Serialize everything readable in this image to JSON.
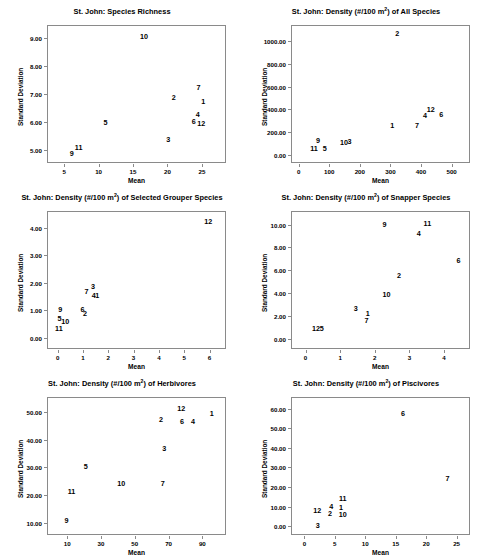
{
  "figure": {
    "shared_xlabel": "Mean",
    "shared_ylabel": "Standard Deviation",
    "superscript": "2",
    "panel_count": 6
  },
  "chart_data": [
    {
      "type": "scatter",
      "id": "species-richness",
      "title": "St. John: Species Richness",
      "title_prefix": "St. John: Species Richness",
      "title_suffix": "",
      "has_superscript": false,
      "xlabel": "Mean",
      "ylabel": "Standard Deviation",
      "xlim": [
        2.5,
        28.5
      ],
      "ylim": [
        4.55,
        9.45
      ],
      "xticks": [
        5,
        10,
        15,
        20,
        25
      ],
      "xticklabels": [
        "5",
        "10",
        "15",
        "20",
        "25"
      ],
      "yticks": [
        5.0,
        6.0,
        7.0,
        8.0,
        9.0
      ],
      "yticklabels": [
        "5.00",
        "6.00",
        "7.00",
        "8.00",
        "9.00"
      ],
      "grid": false,
      "legend": "none",
      "point_labels": [
        "1",
        "2",
        "3",
        "4",
        "5",
        "6",
        "7",
        "9",
        "10",
        "11",
        "12"
      ],
      "points": [
        {
          "label": "10",
          "x": 16.6,
          "y": 9.02
        },
        {
          "label": "7",
          "x": 24.5,
          "y": 7.22
        },
        {
          "label": "2",
          "x": 20.9,
          "y": 6.87
        },
        {
          "label": "1",
          "x": 25.2,
          "y": 6.72
        },
        {
          "label": "4",
          "x": 24.4,
          "y": 6.25
        },
        {
          "label": "6",
          "x": 23.8,
          "y": 6.0
        },
        {
          "label": "12",
          "x": 24.9,
          "y": 5.93
        },
        {
          "label": "5",
          "x": 11.0,
          "y": 5.98
        },
        {
          "label": "3",
          "x": 20.1,
          "y": 5.36
        },
        {
          "label": "11",
          "x": 7.1,
          "y": 5.1
        },
        {
          "label": "9",
          "x": 6.1,
          "y": 4.87
        }
      ]
    },
    {
      "type": "scatter",
      "id": "density-all-species",
      "title": "St. John: Density (#/100 m ) of All Species",
      "title_prefix": "St. John: Density (#/100 m",
      "title_suffix": ") of All Species",
      "has_superscript": true,
      "xlabel": "Mean",
      "ylabel": "Standard Deviation",
      "xlim": [
        -25,
        560
      ],
      "ylim": [
        -70,
        1140
      ],
      "xticks": [
        0,
        100,
        200,
        300,
        400,
        500
      ],
      "xticklabels": [
        "0",
        "100",
        "200",
        "300",
        "400",
        "500"
      ],
      "yticks": [
        0,
        200,
        400,
        600,
        800,
        1000
      ],
      "yticklabels": [
        "0.00",
        "200.00",
        "400.00",
        "600.00",
        "800.00",
        "1000.00"
      ],
      "grid": false,
      "legend": "none",
      "point_labels": [
        "1",
        "2",
        "3",
        "4",
        "5",
        "6",
        "7",
        "9",
        "10",
        "11",
        "12"
      ],
      "points": [
        {
          "label": "2",
          "x": 322,
          "y": 1062
        },
        {
          "label": "12",
          "x": 432,
          "y": 395
        },
        {
          "label": "6",
          "x": 466,
          "y": 348
        },
        {
          "label": "4",
          "x": 413,
          "y": 338
        },
        {
          "label": "7",
          "x": 387,
          "y": 255
        },
        {
          "label": "1",
          "x": 306,
          "y": 254
        },
        {
          "label": "9",
          "x": 63,
          "y": 126
        },
        {
          "label": "3",
          "x": 166,
          "y": 118
        },
        {
          "label": "10",
          "x": 148,
          "y": 104
        },
        {
          "label": "5",
          "x": 85,
          "y": 55
        },
        {
          "label": "11",
          "x": 50,
          "y": 49
        }
      ]
    },
    {
      "type": "scatter",
      "id": "density-selected-grouper",
      "title": "St. John: Density (#/100 m ) of Selected Grouper Species",
      "title_prefix": "St. John: Density (#/100 m",
      "title_suffix": ") of Selected Grouper Species",
      "has_superscript": true,
      "xlabel": "Mean",
      "ylabel": "Standard Deviation",
      "xlim": [
        -0.42,
        6.65
      ],
      "ylim": [
        -0.42,
        4.62
      ],
      "xticks": [
        0,
        1,
        2,
        3,
        4,
        5,
        6
      ],
      "xticklabels": [
        "0",
        "1",
        "2",
        "3",
        "4",
        "5",
        "6"
      ],
      "yticks": [
        0.0,
        1.0,
        2.0,
        3.0,
        4.0
      ],
      "yticklabels": [
        "0.00",
        "1.00",
        "2.00",
        "3.00",
        "4.00"
      ],
      "grid": false,
      "legend": "none",
      "point_labels": [
        "1",
        "2",
        "3",
        "4",
        "5",
        "6",
        "7",
        "9",
        "10",
        "11",
        "12"
      ],
      "points": [
        {
          "label": "12",
          "x": 5.95,
          "y": 4.22
        },
        {
          "label": "3",
          "x": 1.4,
          "y": 1.86
        },
        {
          "label": "7",
          "x": 1.14,
          "y": 1.68
        },
        {
          "label": "4",
          "x": 1.43,
          "y": 1.53
        },
        {
          "label": "1",
          "x": 1.56,
          "y": 1.51
        },
        {
          "label": "9",
          "x": 0.1,
          "y": 1.02
        },
        {
          "label": "6",
          "x": 0.98,
          "y": 1.0
        },
        {
          "label": "2",
          "x": 1.08,
          "y": 0.87
        },
        {
          "label": "5",
          "x": 0.07,
          "y": 0.66
        },
        {
          "label": "10",
          "x": 0.3,
          "y": 0.58
        },
        {
          "label": "11",
          "x": 0.05,
          "y": 0.3
        }
      ]
    },
    {
      "type": "scatter",
      "id": "density-snapper",
      "title": "St. John: Density (#/100 m ) of Snapper Species",
      "title_prefix": "St. John: Density (#/100 m",
      "title_suffix": ") of Snapper Species",
      "has_superscript": true,
      "xlabel": "Mean",
      "ylabel": "Standard Deviation",
      "xlim": [
        -0.42,
        4.75
      ],
      "ylim": [
        -0.9,
        11.2
      ],
      "xticks": [
        0,
        1,
        2,
        3,
        4
      ],
      "xticklabels": [
        "0",
        "1",
        "2",
        "3",
        "4"
      ],
      "yticks": [
        0.0,
        2.0,
        4.0,
        6.0,
        8.0,
        10.0
      ],
      "yticklabels": [
        "0.00",
        "2.00",
        "4.00",
        "6.00",
        "8.00",
        "10.00"
      ],
      "grid": false,
      "legend": "none",
      "point_labels": [
        "1",
        "2",
        "3",
        "4",
        "5",
        "6",
        "7",
        "9",
        "10",
        "11",
        "12"
      ],
      "points": [
        {
          "label": "9",
          "x": 2.28,
          "y": 10.0
        },
        {
          "label": "11",
          "x": 3.52,
          "y": 10.1
        },
        {
          "label": "4",
          "x": 3.27,
          "y": 9.15
        },
        {
          "label": "6",
          "x": 4.42,
          "y": 6.8
        },
        {
          "label": "2",
          "x": 2.7,
          "y": 5.5
        },
        {
          "label": "10",
          "x": 2.34,
          "y": 3.8
        },
        {
          "label": "3",
          "x": 1.45,
          "y": 2.65
        },
        {
          "label": "1",
          "x": 1.8,
          "y": 2.15
        },
        {
          "label": "7",
          "x": 1.76,
          "y": 1.58
        },
        {
          "label": "12",
          "x": 0.3,
          "y": 0.85
        },
        {
          "label": "5",
          "x": 0.47,
          "y": 0.88
        }
      ]
    },
    {
      "type": "scatter",
      "id": "density-herbivores",
      "title": "St. John: Density (#/100 m ) of Herbivores",
      "title_prefix": "St. John: Density (#/100 m",
      "title_suffix": ") of Herbivores",
      "has_superscript": true,
      "xlabel": "Mean",
      "ylabel": "Standard Deviation",
      "xlim": [
        -2,
        104
      ],
      "ylim": [
        5.5,
        55.5
      ],
      "xticks": [
        10,
        30,
        50,
        70,
        90
      ],
      "xticklabels": [
        "10",
        "30",
        "50",
        "70",
        "90"
      ],
      "yticks": [
        10,
        20,
        30,
        40,
        50
      ],
      "yticklabels": [
        "10.00",
        "20.00",
        "30.00",
        "40.00",
        "50.00"
      ],
      "grid": false,
      "legend": "none",
      "point_labels": [
        "1",
        "2",
        "3",
        "4",
        "5",
        "6",
        "7",
        "9",
        "10",
        "11",
        "12"
      ],
      "points": [
        {
          "label": "12",
          "x": 77.5,
          "y": 51.2
        },
        {
          "label": "1",
          "x": 95.5,
          "y": 49.5
        },
        {
          "label": "2",
          "x": 65.5,
          "y": 47.2
        },
        {
          "label": "6",
          "x": 78.0,
          "y": 46.3
        },
        {
          "label": "4",
          "x": 84.5,
          "y": 46.5
        },
        {
          "label": "3",
          "x": 67.5,
          "y": 36.5
        },
        {
          "label": "5",
          "x": 21.0,
          "y": 30.2
        },
        {
          "label": "10",
          "x": 42.0,
          "y": 23.8
        },
        {
          "label": "7",
          "x": 66.5,
          "y": 23.8
        },
        {
          "label": "11",
          "x": 12.5,
          "y": 21.0
        },
        {
          "label": "9",
          "x": 9.5,
          "y": 10.6
        }
      ]
    },
    {
      "type": "scatter",
      "id": "density-piscivores",
      "title": "St. John: Density (#/100 m ) of Piscivores",
      "title_prefix": "St. John: Density (#/100 m",
      "title_suffix": ") of Piscivores",
      "has_superscript": true,
      "xlabel": "Mean",
      "ylabel": "Standard Deviation",
      "xlim": [
        -2.2,
        27.2
      ],
      "ylim": [
        -4.5,
        66
      ],
      "xticks": [
        0,
        5,
        10,
        15,
        20,
        25
      ],
      "xticklabels": [
        "0",
        "5",
        "10",
        "15",
        "20",
        "25"
      ],
      "yticks": [
        0,
        10,
        20,
        30,
        40,
        50,
        60
      ],
      "yticklabels": [
        "0.00",
        "10.00",
        "20.00",
        "30.00",
        "40.00",
        "50.00",
        "60.00"
      ],
      "grid": false,
      "legend": "none",
      "point_labels": [
        "1",
        "2",
        "3",
        "4",
        "6",
        "7",
        "10",
        "11",
        "12"
      ],
      "points": [
        {
          "label": "6",
          "x": 16.2,
          "y": 57.5
        },
        {
          "label": "7",
          "x": 23.5,
          "y": 24.0
        },
        {
          "label": "11",
          "x": 6.3,
          "y": 14.0
        },
        {
          "label": "4",
          "x": 4.4,
          "y": 9.8
        },
        {
          "label": "1",
          "x": 6.0,
          "y": 9.2
        },
        {
          "label": "12",
          "x": 2.1,
          "y": 8.0
        },
        {
          "label": "2",
          "x": 4.2,
          "y": 6.0
        },
        {
          "label": "10",
          "x": 6.3,
          "y": 5.6
        },
        {
          "label": "3",
          "x": 2.2,
          "y": 0.3
        }
      ]
    }
  ]
}
